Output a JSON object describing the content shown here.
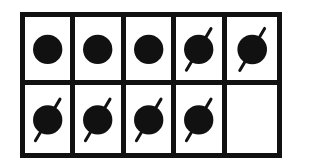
{
  "title": "",
  "frame": {
    "rows": 2,
    "columns": 5,
    "stroke_color": "#111111",
    "fill_color": "#111111"
  },
  "cells": [
    {
      "row": 0,
      "col": 0,
      "content": "dot",
      "crossed": false
    },
    {
      "row": 0,
      "col": 1,
      "content": "dot",
      "crossed": false
    },
    {
      "row": 0,
      "col": 2,
      "content": "dot",
      "crossed": false
    },
    {
      "row": 0,
      "col": 3,
      "content": "dot",
      "crossed": true
    },
    {
      "row": 0,
      "col": 4,
      "content": "dot",
      "crossed": true
    },
    {
      "row": 1,
      "col": 0,
      "content": "dot",
      "crossed": true
    },
    {
      "row": 1,
      "col": 1,
      "content": "dot",
      "crossed": true
    },
    {
      "row": 1,
      "col": 2,
      "content": "dot",
      "crossed": true
    },
    {
      "row": 1,
      "col": 3,
      "content": "dot",
      "crossed": true
    },
    {
      "row": 1,
      "col": 4,
      "content": "empty",
      "crossed": false
    }
  ],
  "summary": {
    "total_cells": 10,
    "filled_dots": 9,
    "crossed_out_dots": 6,
    "remaining_dots": 3,
    "empty_cells": 1
  }
}
